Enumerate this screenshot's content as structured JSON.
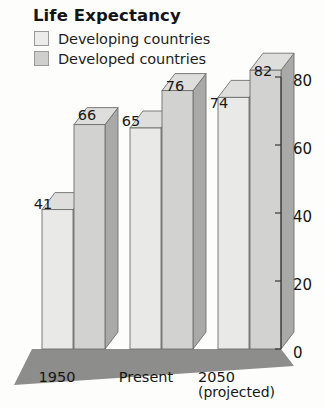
{
  "chart_data": {
    "type": "bar",
    "title": "Life Expectancy",
    "xlabel": "",
    "ylabel": "",
    "ylim": [
      0,
      80
    ],
    "yticks": [
      0,
      20,
      40,
      60,
      80
    ],
    "grid": false,
    "legend_position": "top-left",
    "axis_side": "right",
    "style": "3d-bar",
    "categories": [
      "1950",
      "Present",
      "2050"
    ],
    "category_sublabels": [
      "",
      "",
      "(projected)"
    ],
    "series": [
      {
        "name": "Developing countries",
        "values": [
          41,
          65,
          74
        ],
        "color": "#e9e9e7"
      },
      {
        "name": "Developed countries",
        "values": [
          66,
          76,
          82
        ],
        "color": "#d2d2d0"
      }
    ],
    "floor_color": "#8d8d8b",
    "side_face_color": "#a9a9a7",
    "top_face_color": "#dededc",
    "outline_color": "#6f6f6d"
  },
  "legend": {
    "items": [
      {
        "label": "Developing countries",
        "swatch": "#ececea"
      },
      {
        "label": "Developed countries",
        "swatch": "#cfcfcd"
      }
    ]
  },
  "axis": {
    "tick_labels": [
      "80",
      "60",
      "40",
      "20",
      "0"
    ]
  },
  "value_labels": [
    "41",
    "66",
    "65",
    "76",
    "74",
    "82"
  ],
  "x_labels": [
    {
      "main": "1950",
      "sub": ""
    },
    {
      "main": "Present",
      "sub": ""
    },
    {
      "main": "2050",
      "sub": "(projected)"
    }
  ]
}
